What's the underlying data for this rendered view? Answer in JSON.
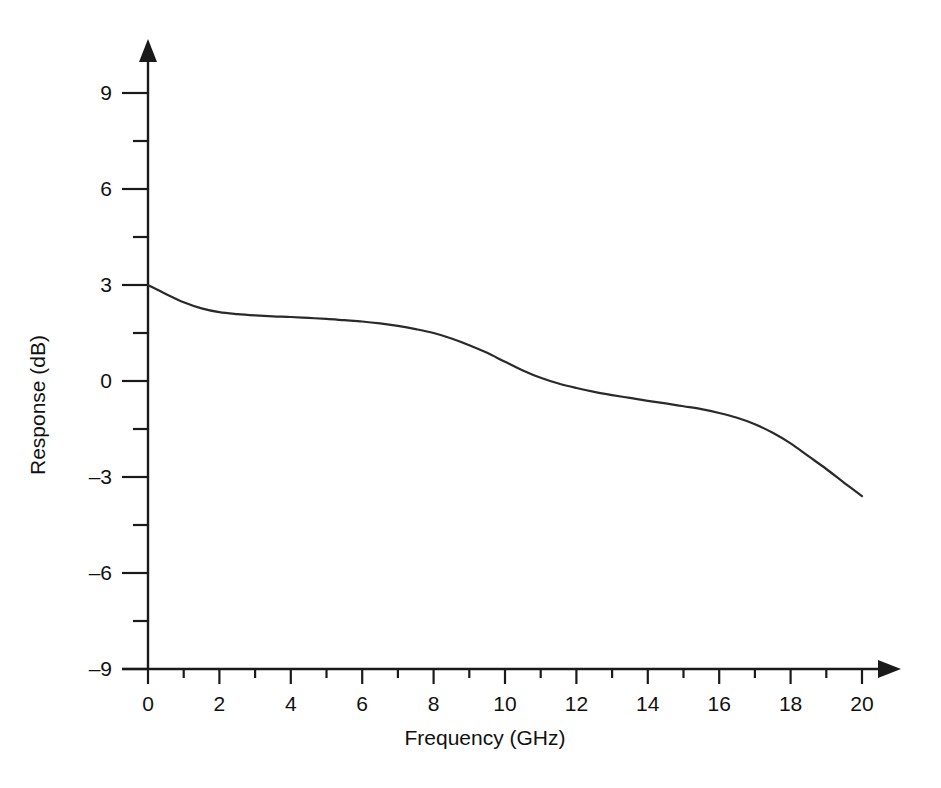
{
  "chart_data": {
    "type": "line",
    "title": "",
    "xlabel": "Frequency (GHz)",
    "ylabel": "Response (dB)",
    "xlim": [
      0,
      20
    ],
    "ylim": [
      -9,
      10.5
    ],
    "grid": false,
    "legend": null,
    "x_ticks_major": [
      0,
      2,
      4,
      6,
      8,
      10,
      12,
      14,
      16,
      18,
      20
    ],
    "x_ticks_minor": [
      1,
      3,
      5,
      7,
      9,
      11,
      13,
      15,
      17,
      19
    ],
    "x_tick_labels": [
      "0",
      "2",
      "4",
      "6",
      "8",
      "10",
      "12",
      "14",
      "16",
      "18",
      "20"
    ],
    "y_ticks_major": [
      -9,
      -6,
      -3,
      0,
      3,
      6,
      9
    ],
    "y_ticks_minor": [
      -7.5,
      -4.5,
      -1.5,
      1.5,
      4.5,
      7.5
    ],
    "y_tick_labels": [
      "–9",
      "–6",
      "–3",
      "0",
      "3",
      "6",
      "9"
    ],
    "axis_style": "arrow-tipped open axes",
    "series": [
      {
        "name": "Response",
        "color": "#2a2a2a",
        "x": [
          0.0,
          0.5,
          1.0,
          1.5,
          2.0,
          2.5,
          3.0,
          3.5,
          4.0,
          4.5,
          5.0,
          5.5,
          6.0,
          6.5,
          7.0,
          7.5,
          8.0,
          8.5,
          9.0,
          9.5,
          10.0,
          10.5,
          11.0,
          11.5,
          12.0,
          12.5,
          13.0,
          13.5,
          14.0,
          14.5,
          15.0,
          15.5,
          16.0,
          16.5,
          17.0,
          17.5,
          18.0,
          18.5,
          19.0,
          19.5,
          20.0
        ],
        "y": [
          3.0,
          2.72,
          2.46,
          2.27,
          2.15,
          2.09,
          2.05,
          2.02,
          2.0,
          1.97,
          1.94,
          1.9,
          1.86,
          1.8,
          1.72,
          1.62,
          1.5,
          1.33,
          1.12,
          0.88,
          0.6,
          0.33,
          0.1,
          -0.08,
          -0.22,
          -0.34,
          -0.44,
          -0.53,
          -0.62,
          -0.7,
          -0.79,
          -0.88,
          -1.0,
          -1.15,
          -1.35,
          -1.62,
          -1.95,
          -2.35,
          -2.75,
          -3.18,
          -3.6
        ]
      }
    ]
  },
  "geometry": {
    "x_axis_label_text": "Frequency (GHz)",
    "y_axis_label_text": "Response (dB)"
  }
}
